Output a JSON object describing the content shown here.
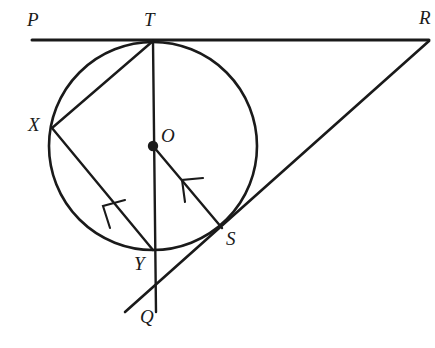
{
  "figure": {
    "type": "geometry-diagram",
    "width": 435,
    "height": 348,
    "background_color": "#ffffff",
    "stroke_color": "#1a1a1a"
  },
  "circle": {
    "name": "main-circle",
    "center": {
      "x": 153,
      "y": 146
    },
    "radius": 104,
    "stroke_width": 2.6
  },
  "center_point": {
    "label": "O",
    "x": 153,
    "y": 146,
    "dot_radius": 5.2,
    "label_x": 161,
    "label_y": 126
  },
  "points": [
    {
      "id": "P",
      "label": "P",
      "x": 32,
      "y": 40,
      "label_x": 27,
      "label_y": 10,
      "on_circle": false
    },
    {
      "id": "T",
      "label": "T",
      "x": 153,
      "y": 41,
      "label_x": 144,
      "label_y": 10,
      "on_circle": true
    },
    {
      "id": "R",
      "label": "R",
      "x": 428,
      "y": 40,
      "label_x": 419,
      "label_y": 8,
      "on_circle": false
    },
    {
      "id": "X",
      "label": "X",
      "x": 52,
      "y": 128,
      "label_x": 28,
      "label_y": 115,
      "on_circle": true
    },
    {
      "id": "S",
      "label": "S",
      "x": 222,
      "y": 228,
      "label_x": 226,
      "label_y": 229,
      "on_circle": true
    },
    {
      "id": "Y",
      "label": "Y",
      "x": 153,
      "y": 250,
      "label_x": 134,
      "label_y": 254,
      "on_circle": true
    },
    {
      "id": "Q",
      "label": "Q",
      "x": 156,
      "y": 312,
      "label_x": 140,
      "label_y": 307,
      "on_circle": false
    }
  ],
  "segments": [
    {
      "id": "PR",
      "name": "tangent-line-PR",
      "from": {
        "x": 32,
        "y": 40
      },
      "to": {
        "x": 429,
        "y": 40
      },
      "stroke_width": 3.0,
      "arrow": false
    },
    {
      "id": "TQ",
      "name": "diameter-line-TQ",
      "from": {
        "x": 153,
        "y": 41
      },
      "to": {
        "x": 156,
        "y": 312
      },
      "stroke_width": 2.4,
      "arrow": false
    },
    {
      "id": "TX",
      "name": "chord-TX",
      "from": {
        "x": 153,
        "y": 41
      },
      "to": {
        "x": 52,
        "y": 128
      },
      "stroke_width": 2.4,
      "arrow": false
    },
    {
      "id": "XY",
      "name": "chord-XY-arrowed",
      "from": {
        "x": 153,
        "y": 250
      },
      "to": {
        "x": 52,
        "y": 128
      },
      "stroke_width": 2.4,
      "arrow": true,
      "arrow_at": {
        "x": 104,
        "y": 208
      }
    },
    {
      "id": "SO",
      "name": "radius-SO-arrowed",
      "from": {
        "x": 222,
        "y": 228
      },
      "to": {
        "x": 153,
        "y": 146
      },
      "stroke_width": 2.4,
      "arrow": true,
      "arrow_at": {
        "x": 184,
        "y": 183
      }
    },
    {
      "id": "QSR",
      "name": "secant-line-QR",
      "from": {
        "x": 125,
        "y": 312
      },
      "to": {
        "x": 429,
        "y": 41
      },
      "stroke_width": 2.6,
      "arrow": false
    }
  ],
  "arrowheads": [
    {
      "id": "arrow-XY",
      "name": "arrowhead-toward-X",
      "tip": {
        "x": 103,
        "y": 206
      },
      "angle_deg": 230
    },
    {
      "id": "arrow-SO",
      "name": "arrowhead-toward-O",
      "tip": {
        "x": 182,
        "y": 180
      },
      "angle_deg": 230
    }
  ]
}
